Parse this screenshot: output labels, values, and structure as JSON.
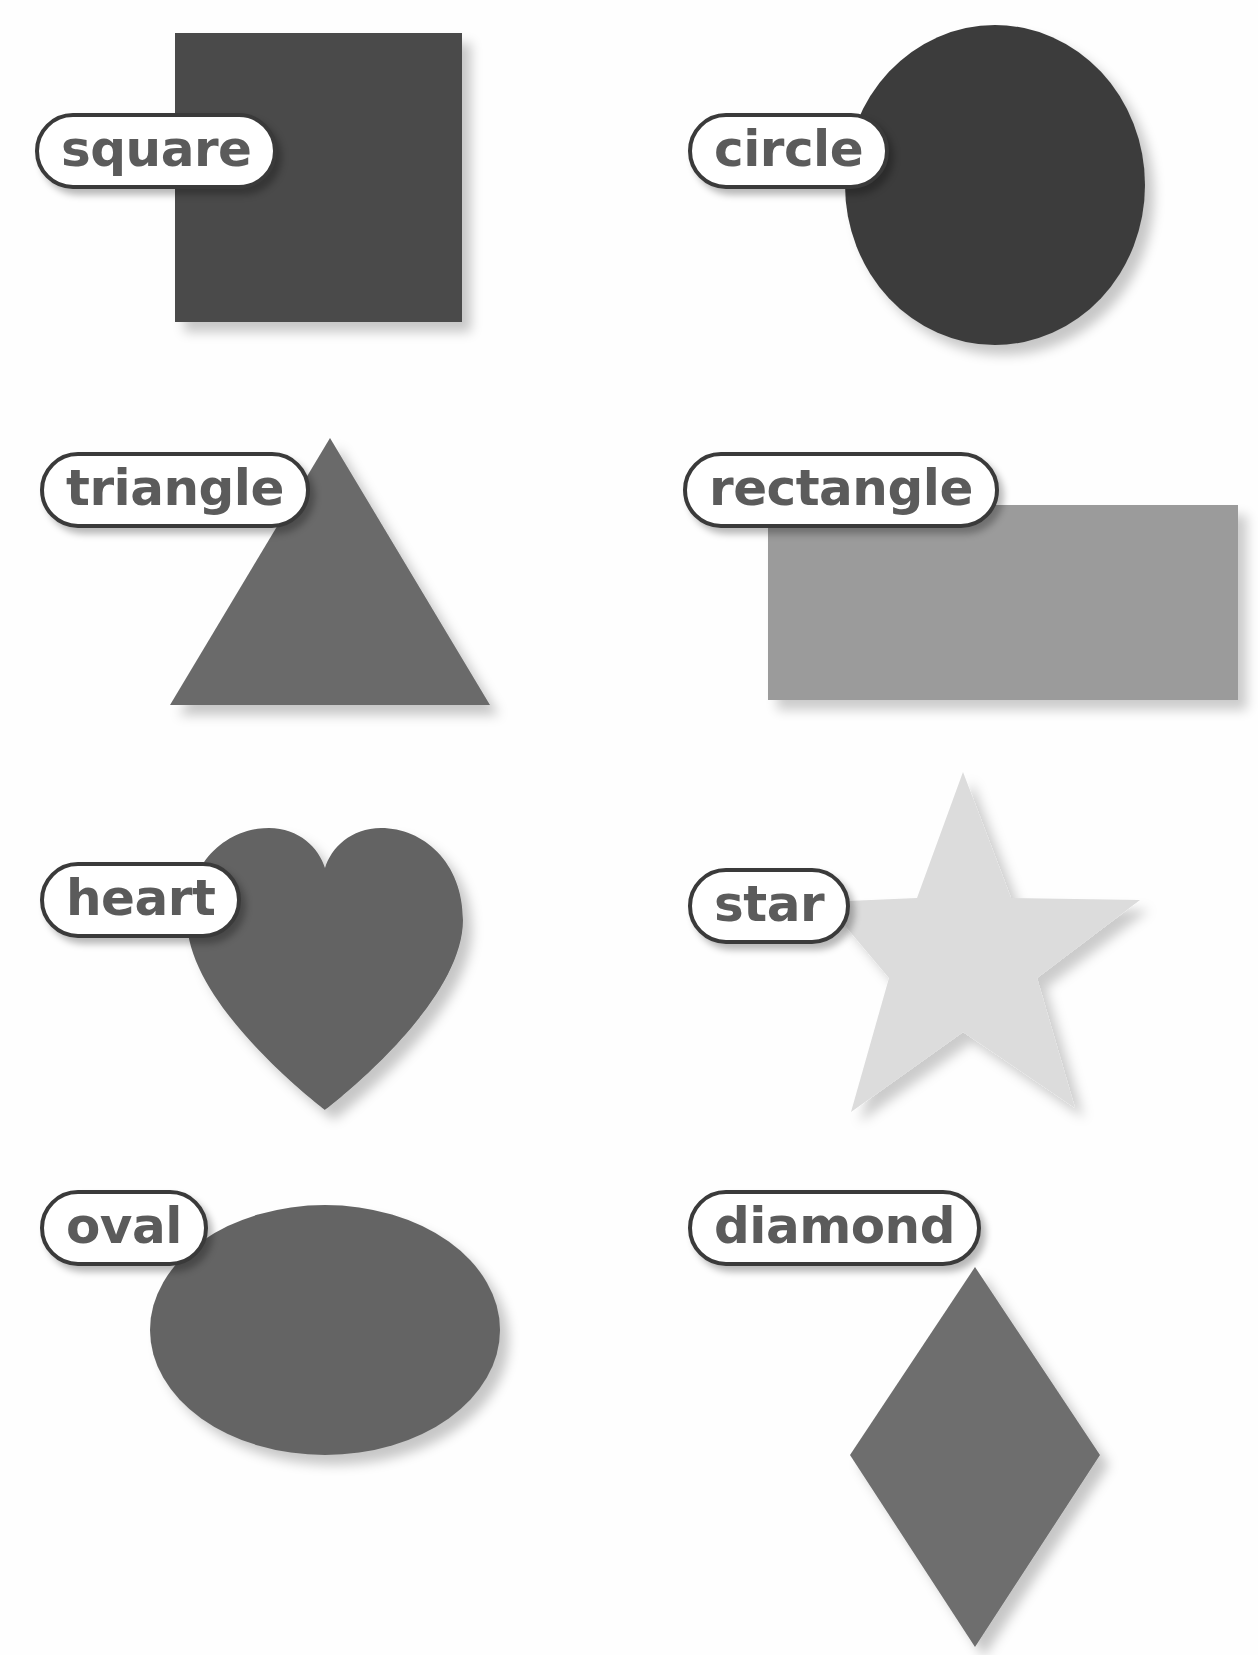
{
  "page": {
    "background_color": "#ffffff",
    "columns": 2,
    "rows": 4,
    "label_style": {
      "fill": "#ffffff",
      "border_color": "#3a3a3a",
      "text_color": "#5b5b5b"
    }
  },
  "shapes": [
    {
      "id": "square",
      "label": "square",
      "icon": "square-shape-icon",
      "color": "#4a4a4a",
      "row": 1,
      "column": 1,
      "box": {
        "x": 175,
        "y": 33,
        "w": 287,
        "h": 289
      },
      "label_box": {
        "x": 35,
        "y": 113,
        "w": 200,
        "h": 76
      }
    },
    {
      "id": "circle",
      "label": "circle",
      "icon": "circle-shape-icon",
      "color": "#3c3c3c",
      "row": 1,
      "column": 2,
      "box": {
        "x": 845,
        "y": 25,
        "w": 300,
        "h": 320
      },
      "label_box": {
        "x": 688,
        "y": 113,
        "w": 190,
        "h": 76
      }
    },
    {
      "id": "triangle",
      "label": "triangle",
      "icon": "triangle-shape-icon",
      "color": "#6b6b6b",
      "row": 2,
      "column": 1,
      "box": {
        "x": 155,
        "y": 410,
        "w": 335,
        "h": 295
      },
      "label_box": {
        "x": 40,
        "y": 452,
        "w": 230,
        "h": 76
      }
    },
    {
      "id": "rectangle",
      "label": "rectangle",
      "icon": "rectangle-shape-icon",
      "color": "#9b9b9b",
      "row": 2,
      "column": 2,
      "box": {
        "x": 768,
        "y": 505,
        "w": 470,
        "h": 195
      },
      "label_box": {
        "x": 683,
        "y": 452,
        "w": 240,
        "h": 76
      }
    },
    {
      "id": "heart",
      "label": "heart",
      "icon": "heart-shape-icon",
      "color": "#646464",
      "row": 3,
      "column": 1,
      "box": {
        "x": 185,
        "y": 823,
        "w": 290,
        "h": 290
      },
      "label_box": {
        "x": 40,
        "y": 862,
        "w": 165,
        "h": 76
      }
    },
    {
      "id": "star",
      "label": "star",
      "icon": "star-shape-icon",
      "color": "#dcdcdc",
      "row": 3,
      "column": 2,
      "box": {
        "x": 825,
        "y": 768,
        "w": 300,
        "h": 350
      },
      "label_box": {
        "x": 688,
        "y": 868,
        "w": 155,
        "h": 76
      }
    },
    {
      "id": "oval",
      "label": "oval",
      "icon": "oval-shape-icon",
      "color": "#646464",
      "row": 4,
      "column": 1,
      "box": {
        "x": 150,
        "y": 1205,
        "w": 350,
        "h": 250
      },
      "label_box": {
        "x": 40,
        "y": 1190,
        "w": 145,
        "h": 76
      }
    },
    {
      "id": "diamond",
      "label": "diamond",
      "icon": "diamond-shape-icon",
      "color": "#6e6e6e",
      "row": 4,
      "column": 2,
      "box": {
        "x": 845,
        "y": 1268,
        "w": 265,
        "h": 380
      },
      "label_box": {
        "x": 688,
        "y": 1190,
        "w": 258,
        "h": 76
      }
    }
  ]
}
